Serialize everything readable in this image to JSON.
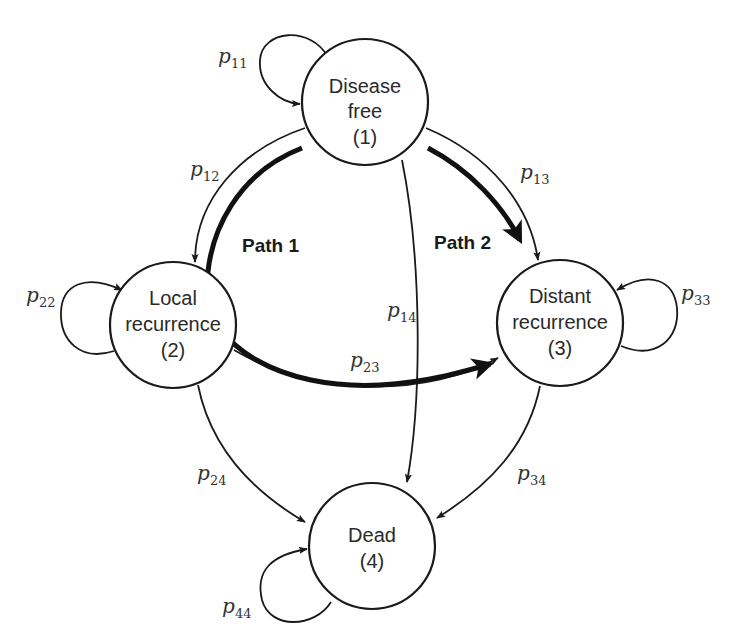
{
  "diagram": {
    "type": "markov-state-transition",
    "states": [
      {
        "id": 1,
        "line1": "Disease",
        "line2": "free",
        "index": "(1)"
      },
      {
        "id": 2,
        "line1": "Local",
        "line2": "recurrence",
        "index": "(2)"
      },
      {
        "id": 3,
        "line1": "Distant",
        "line2": "recurrence",
        "index": "(3)"
      },
      {
        "id": 4,
        "line1": "Dead",
        "line2": "",
        "index": "(4)"
      }
    ],
    "transitions": [
      {
        "from": 1,
        "to": 1,
        "label": "p",
        "sub": "11"
      },
      {
        "from": 1,
        "to": 2,
        "label": "p",
        "sub": "12"
      },
      {
        "from": 1,
        "to": 3,
        "label": "p",
        "sub": "13"
      },
      {
        "from": 1,
        "to": 4,
        "label": "p",
        "sub": "14"
      },
      {
        "from": 2,
        "to": 2,
        "label": "p",
        "sub": "22"
      },
      {
        "from": 2,
        "to": 3,
        "label": "p",
        "sub": "23"
      },
      {
        "from": 2,
        "to": 4,
        "label": "p",
        "sub": "24"
      },
      {
        "from": 3,
        "to": 3,
        "label": "p",
        "sub": "33"
      },
      {
        "from": 3,
        "to": 4,
        "label": "p",
        "sub": "34"
      },
      {
        "from": 4,
        "to": 4,
        "label": "p",
        "sub": "44"
      }
    ],
    "paths": [
      {
        "label": "Path 1",
        "route": "1 → 2 → 3"
      },
      {
        "label": "Path 2",
        "route": "1 → 3"
      }
    ],
    "colors": {
      "stroke": "#1a1a1a",
      "background": "#ffffff",
      "text": "#2a2a2a"
    }
  }
}
